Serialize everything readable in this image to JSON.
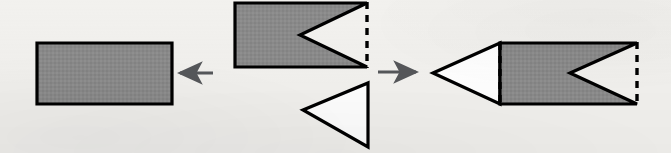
{
  "figure": {
    "canvas": {
      "width": 671,
      "height": 153
    }
  },
  "colors": {
    "background": "#f2f1ee",
    "shape_fill_gray": "#8a8a8a",
    "shape_fill_white": "#ffffff",
    "outline_black": "#000000",
    "arrow_gray": "#55575a"
  },
  "style": {
    "outline_width": 3.2,
    "dash_pattern": "7 6",
    "arrow_line_width": 3
  },
  "shapes": [
    {
      "id": "left-rectangle",
      "name": "shaded-rectangle",
      "kind": "rectangle",
      "fill": "gray",
      "outline": "solid",
      "points": "37,43 172,43 172,104 37,104"
    },
    {
      "id": "middle-notched-rectangle",
      "name": "notched-rectangle",
      "kind": "polygon",
      "fill": "gray",
      "outline": "solid",
      "points": "235,3 367,3 300,35 367,67 235,67",
      "dashed_edge": "367,3 367,67",
      "notch_apex": "300,35"
    },
    {
      "id": "middle-triangle",
      "name": "white-triangle",
      "kind": "triangle",
      "fill": "white",
      "outline": "solid",
      "points": "303,110 368,83 368,147"
    },
    {
      "id": "right-composite-triangle",
      "name": "attached-white-triangle",
      "kind": "triangle",
      "fill": "white",
      "outline": "solid",
      "points": "433,73 500,43 500,104"
    },
    {
      "id": "right-composite-notched-rectangle",
      "name": "attached-notched-rectangle",
      "kind": "polygon",
      "fill": "gray",
      "outline": "solid",
      "points": "500,43 637,43 570,73 637,104 500,104",
      "dashed_edges": [
        "500,43 500,104",
        "637,43 637,104"
      ],
      "notch_apex": "570,73"
    }
  ],
  "arrows": [
    {
      "id": "arrow-left",
      "name": "left-pointing-arrow",
      "direction": "left",
      "tail": "213,73",
      "head": "176,73"
    },
    {
      "id": "arrow-right",
      "name": "right-pointing-arrow",
      "direction": "right",
      "tail": "378,72",
      "head": "420,72"
    }
  ]
}
